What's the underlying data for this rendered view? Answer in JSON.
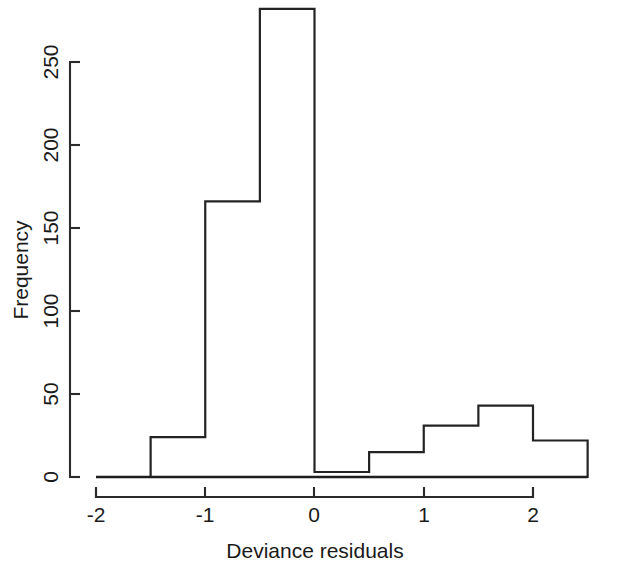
{
  "chart_data": {
    "type": "bar",
    "title": "",
    "subtitle": "",
    "xlabel": "Deviance residuals",
    "ylabel": "Frequency",
    "xlim": [
      -2.0,
      2.5
    ],
    "ylim": [
      0,
      290
    ],
    "grid": false,
    "legend": null,
    "bin_width": 0.5,
    "bin_edges": [
      -2.0,
      -1.5,
      -1.0,
      -0.5,
      0.0,
      0.5,
      1.0,
      1.5,
      2.0,
      2.5
    ],
    "categories": [
      "[-2.0,-1.5)",
      "[-1.5,-1.0)",
      "[-1.0,-0.5)",
      "[-0.5,0.0)",
      "[0.0,0.5)",
      "[0.5,1.0)",
      "[1.0,1.5)",
      "[1.5,2.0)",
      "[2.0,2.5)"
    ],
    "values": [
      0,
      24,
      166,
      282,
      3,
      15,
      31,
      43,
      22
    ],
    "x_ticks": [
      -2,
      -1,
      0,
      1,
      2
    ],
    "x_tick_labels": [
      "-2",
      "-1",
      "0",
      "1",
      "2"
    ],
    "y_ticks": [
      0,
      50,
      100,
      150,
      200,
      250
    ],
    "y_tick_labels": [
      "0",
      "50",
      "100",
      "150",
      "200",
      "250"
    ],
    "bar_fill": "#ffffff",
    "bar_stroke": "#232323",
    "axis_color": "#2b2b2b",
    "background": "#ffffff"
  },
  "axes": {
    "y_label": "Frequency",
    "x_label": "Deviance residuals",
    "y_tick_0": "0",
    "y_tick_1": "50",
    "y_tick_2": "100",
    "y_tick_3": "150",
    "y_tick_4": "200",
    "y_tick_5": "250",
    "x_tick_0": "-2",
    "x_tick_1": "-1",
    "x_tick_2": "0",
    "x_tick_3": "1",
    "x_tick_4": "2"
  }
}
